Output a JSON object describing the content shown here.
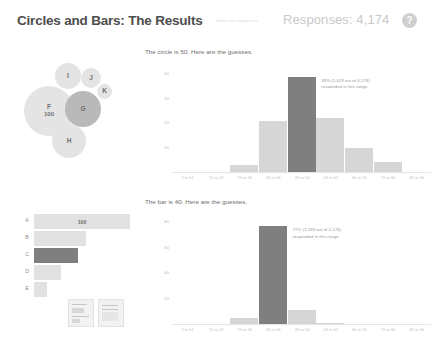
{
  "header": {
    "app_title": "Circles and Bars: The Results",
    "secondary_link": "Show all responses",
    "separator_dot": "·",
    "responses_label": "Responses: 4,174",
    "help_icon_glyph": "?",
    "help_icon_name": "question-mark-icon"
  },
  "colors": {
    "bar_light": "#d6d6d6",
    "bar_highlight": "#7f7f7f",
    "bubble_light": "#e4e4e4",
    "bubble_highlight": "#b9b9b9",
    "text_muted": "#9a9a9a",
    "title_text": "#4d4d4d",
    "responses_text": "#c9c9c9"
  },
  "bubble_chart": {
    "name": "circles-stimulus",
    "bubbles": [
      {
        "label": "F",
        "value": "100",
        "x": 6,
        "y": 30,
        "size": 50,
        "highlight": false
      },
      {
        "label": "G",
        "value": "",
        "x": 47,
        "y": 35,
        "size": 36,
        "highlight": true
      },
      {
        "label": "H",
        "value": "",
        "x": 34,
        "y": 68,
        "size": 34,
        "highlight": false
      },
      {
        "label": "I",
        "value": "",
        "x": 37,
        "y": 7,
        "size": 26,
        "highlight": false
      },
      {
        "label": "J",
        "value": "",
        "x": 63,
        "y": 12,
        "size": 20,
        "highlight": false
      },
      {
        "label": "K",
        "value": "",
        "x": 79,
        "y": 28,
        "size": 15,
        "highlight": false
      }
    ]
  },
  "bar_stimulus": {
    "name": "bars-stimulus",
    "rows": [
      {
        "cat": "A",
        "width": 96,
        "value": "100",
        "highlight": false
      },
      {
        "cat": "B",
        "width": 52,
        "value": "",
        "highlight": false
      },
      {
        "cat": "C",
        "width": 44,
        "value": "",
        "highlight": true
      },
      {
        "cat": "D",
        "width": 27,
        "value": "",
        "highlight": false
      },
      {
        "cat": "E",
        "width": 13,
        "value": "",
        "highlight": false
      }
    ]
  },
  "thumbnails": [
    {
      "name": "thumbnail-circles"
    },
    {
      "name": "thumbnail-bars"
    }
  ],
  "chart_data": [
    {
      "type": "bar",
      "name": "circle-guesses-histogram",
      "title": "The circle is 50.  Here are the guesses.",
      "categories": [
        "5 to 14",
        "15 to 24",
        "25 to 34",
        "35 to 44",
        "45 to 54",
        "55 to 64",
        "65 to 74",
        "75 to 84",
        "85 to 94"
      ],
      "values": [
        0,
        0,
        3,
        21,
        39,
        22,
        10,
        4,
        0
      ],
      "ylabel": "",
      "xlabel": "",
      "ytick_labels": [
        "40",
        "30",
        "20",
        "10"
      ],
      "ytick_values": [
        40,
        30,
        20,
        10
      ],
      "ylim": [
        0,
        45
      ],
      "grid": false,
      "legend": "none",
      "annotation": {
        "line1": "39% (1,629 out of 4,174)",
        "line2": "responded in this range."
      },
      "highlight_category": "45 to 54"
    },
    {
      "type": "bar",
      "name": "bar-guesses-histogram",
      "title": "The bar is 40.  Here are the guesses.",
      "categories": [
        "5 to 14",
        "15 to 24",
        "25 to 34",
        "35 to 44",
        "45 to 54",
        "55 to 64",
        "65 to 74",
        "75 to 84",
        "85 to 94"
      ],
      "values": [
        0,
        0,
        5,
        77,
        11,
        1,
        0,
        0,
        0
      ],
      "ylabel": "",
      "xlabel": "",
      "ytick_labels": [
        "80",
        "60",
        "40",
        "20"
      ],
      "ytick_values": [
        80,
        60,
        40,
        20
      ],
      "ylim": [
        0,
        88
      ],
      "grid": false,
      "legend": "none",
      "annotation": {
        "line1": "77% (3,183 out of 4,174)",
        "line2": "responded in this range."
      },
      "highlight_category": "35 to 44"
    }
  ]
}
